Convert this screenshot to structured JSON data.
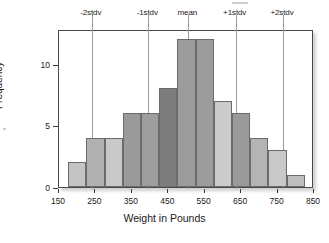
{
  "chart_data": {
    "type": "bar",
    "title": "",
    "xlabel": "Weight in Pounds",
    "ylabel": "Frequency",
    "xlim": [
      150,
      850
    ],
    "ylim": [
      0,
      12.8
    ],
    "grid": false,
    "legend": null,
    "bin_width": 50,
    "categories": [
      "175-225",
      "225-275",
      "275-325",
      "325-375",
      "375-425",
      "425-475",
      "475-525",
      "525-575",
      "575-625",
      "625-675",
      "675-725",
      "725-775",
      "775-825"
    ],
    "bin_starts": [
      175,
      225,
      275,
      325,
      375,
      425,
      475,
      525,
      575,
      625,
      675,
      725,
      775
    ],
    "values": [
      2,
      4,
      4,
      6,
      6,
      8,
      12,
      12,
      7,
      6,
      4,
      3,
      1
    ],
    "bar_colors": [
      "#c4c4c4",
      "#b0b0b0",
      "#c9c9c9",
      "#9a9a9a",
      "#9e9e9e",
      "#7d7d7d",
      "#9c9c9c",
      "#9c9c9c",
      "#cbcbcb",
      "#9a9a9a",
      "#b4b4b4",
      "#c9c9c9",
      "#bdbdbd"
    ],
    "xticks": [
      150,
      250,
      350,
      450,
      550,
      650,
      750,
      850
    ],
    "xtick_labels": [
      "150",
      "250",
      "350",
      "450",
      "550",
      "650",
      "750",
      "850"
    ],
    "yticks": [
      0,
      5,
      10
    ],
    "ytick_labels": [
      "0",
      "5",
      "10"
    ],
    "annotations": [
      {
        "label": "-2stdv",
        "x": 240
      },
      {
        "label": "-1stdv",
        "x": 395
      },
      {
        "label": "mean",
        "x": 505
      },
      {
        "label": "+1stdv",
        "x": 635
      },
      {
        "label": "+2stdv",
        "x": 765
      }
    ],
    "colors": {
      "axis": "#3a3a3a",
      "frame": "#4a4a4a",
      "guide_line": "#9a9a9a",
      "bar_edge": "#6b6b6b",
      "text": "#1a1a1a",
      "background": "#ffffff"
    }
  }
}
